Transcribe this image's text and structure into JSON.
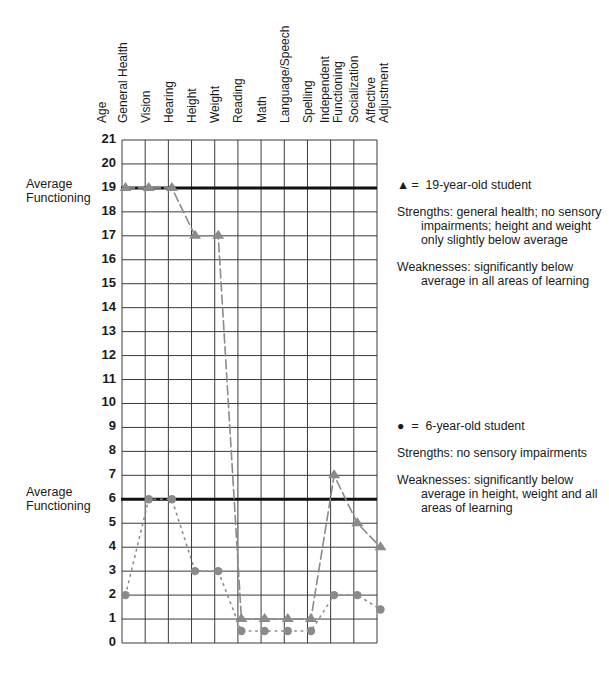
{
  "chart_data": {
    "type": "line",
    "title": "",
    "xlabel": "",
    "ylabel": "Age",
    "ylim": [
      0,
      21
    ],
    "yticks": [
      0,
      1,
      2,
      3,
      4,
      5,
      6,
      7,
      8,
      9,
      10,
      11,
      12,
      13,
      14,
      15,
      16,
      17,
      18,
      19,
      20,
      21
    ],
    "grid": true,
    "categories": [
      "General Health",
      "Vision",
      "Hearing",
      "Height",
      "Weight",
      "Reading",
      "Math",
      "Language/Speech",
      "Spelling",
      "Independent Functioning",
      "Socialization",
      "Affective Adjustment"
    ],
    "series": [
      {
        "name": "19-year-old student",
        "marker": "triangle",
        "line": "dashed",
        "values": [
          19,
          19,
          19,
          17,
          17,
          1,
          1,
          1,
          1,
          7,
          5,
          4
        ]
      },
      {
        "name": "6-year-old student",
        "marker": "circle",
        "line": "dotted",
        "values": [
          2,
          6,
          6,
          3,
          3,
          0.5,
          0.5,
          0.5,
          0.5,
          2,
          2,
          1.4
        ]
      }
    ],
    "reference_lines": [
      {
        "label": "Average Functioning",
        "y": 19
      },
      {
        "label": "Average Functioning",
        "y": 6
      }
    ],
    "annotations": [
      {
        "symbol": "▲",
        "label": "19-year-old student",
        "strengths": "general health; no sensory impairments; height and weight only slightly below average",
        "weaknesses": "significantly below average in all areas of learning"
      },
      {
        "symbol": "●",
        "label": "6-year-old student",
        "strengths": "no sensory impairments",
        "weaknesses": "significantly below average in height, weight and all areas of learning"
      }
    ]
  },
  "axis": {
    "age_label": "Age",
    "category_labels": [
      [
        "General Health"
      ],
      [
        "Vision"
      ],
      [
        "Hearing"
      ],
      [
        "Height"
      ],
      [
        "Weight"
      ],
      [
        "Reading"
      ],
      [
        "Math"
      ],
      [
        "Language/Speech"
      ],
      [
        "Spelling"
      ],
      [
        "Independent",
        "Functioning"
      ],
      [
        "Socialization"
      ],
      [
        "Affective",
        "Adjustment"
      ]
    ]
  },
  "reference_labels": {
    "upper": {
      "line1": "Average",
      "line2": "Functioning"
    },
    "lower": {
      "line1": "Average",
      "line2": "Functioning"
    }
  },
  "legend": {
    "older": {
      "symbol": "▲",
      "eq": "=",
      "label": "19-year-old student",
      "strengths_key": "Strengths:",
      "strengths": "general health; no sensory impairments; height and weight only slightly below average",
      "weaknesses_key": "Weaknesses:",
      "weaknesses": "significantly below average in all areas of learning"
    },
    "younger": {
      "symbol": "●",
      "eq": "=",
      "label": "6-year-old student",
      "strengths_key": "Strengths:",
      "strengths": "no sensory impairments",
      "weaknesses_key": "Weaknesses:",
      "weaknesses": "significantly below average in height, weight and all areas of learning"
    }
  },
  "colors": {
    "grid": "#3a3a3a",
    "reference_line": "#111111",
    "series_marker": "#8a8a8a",
    "text": "#1a1a1a"
  }
}
